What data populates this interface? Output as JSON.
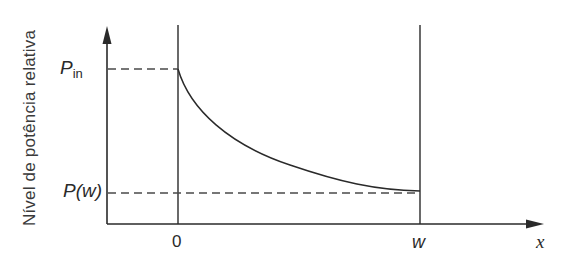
{
  "diagram": {
    "y_axis_label": "Nível de potência relativa",
    "x_axis_label": "x",
    "y_markers": {
      "p_in": {
        "symbol": "P",
        "subscript": "in"
      },
      "p_w": {
        "symbol": "P(w)"
      }
    },
    "x_ticks": {
      "zero": "0",
      "w": "w"
    },
    "curve": "exponential decay from P_in at x=0 to P(w) at x=w",
    "colors": {
      "line": "#2a2a2a",
      "dashed": "#4a4a4a",
      "background": "#ffffff"
    }
  }
}
